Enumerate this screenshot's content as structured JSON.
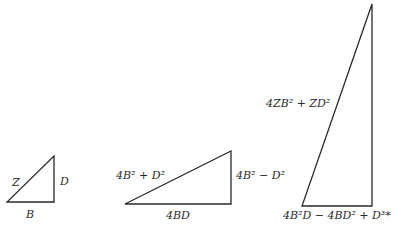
{
  "diagram": {
    "stroke_color": "#2a2a2a",
    "background": "#ffffff",
    "triangles": [
      {
        "id": "small",
        "vertices": [
          [
            7,
            202
          ],
          [
            54,
            202
          ],
          [
            54,
            156
          ]
        ],
        "labels": {
          "hypotenuse": "Z",
          "vertical": "D",
          "base": "B"
        }
      },
      {
        "id": "medium",
        "vertices": [
          [
            125,
            204
          ],
          [
            231,
            204
          ],
          [
            231,
            151
          ]
        ],
        "labels": {
          "hypotenuse": "4B² + D²",
          "vertical": "4B² − D²",
          "base": "4BD"
        }
      },
      {
        "id": "large",
        "vertices": [
          [
            302,
            206
          ],
          [
            372,
            206
          ],
          [
            372,
            4
          ]
        ],
        "labels": {
          "hypotenuse": "4ZB² + ZD²",
          "base": "4B²D − 4BD² + D³*"
        }
      }
    ]
  }
}
